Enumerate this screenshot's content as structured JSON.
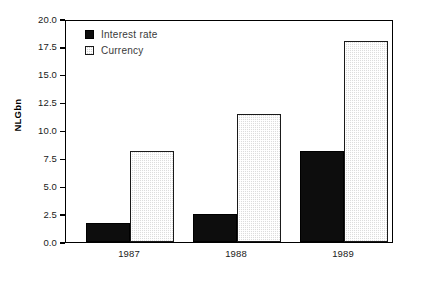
{
  "chart_data": {
    "type": "bar",
    "title": "",
    "subtitle": "",
    "xlabel": "",
    "ylabel": "NLGbn",
    "categories": [
      "1987",
      "1988",
      "1989"
    ],
    "series": [
      {
        "name": "Interest rate",
        "values": [
          1.7,
          2.5,
          8.2
        ],
        "color": "#0d0d0d",
        "pattern": "solid"
      },
      {
        "name": "Currency",
        "values": [
          8.2,
          11.5,
          18.0
        ],
        "color": "#d2d2d2",
        "pattern": "checkered"
      }
    ],
    "ylim": [
      0.0,
      20.0
    ],
    "ytick_values": [
      0.0,
      2.5,
      5.0,
      7.5,
      10.0,
      12.5,
      15.0,
      17.5,
      20.0
    ],
    "ytick_labels": [
      "0.0",
      "2.5",
      "5.0",
      "7.5",
      "10.0",
      "12.5",
      "15.0",
      "17.5",
      "20.0"
    ],
    "grid": false,
    "legend_position": "top-left-inside",
    "legend_entries": [
      "Interest rate",
      "Currency"
    ],
    "annotations": [],
    "frame": "box",
    "background_color": "#ffffff"
  }
}
